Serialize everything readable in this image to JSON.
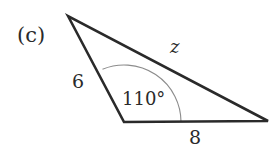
{
  "diagram": {
    "part_label": "(c)",
    "type": "triangle",
    "vertices": {
      "top": [
        68,
        16
      ],
      "bottom_left": [
        124,
        122
      ],
      "right": [
        268,
        121
      ]
    },
    "sides": {
      "left_side": "6",
      "bottom_side": "8",
      "long_side": "z"
    },
    "angle": {
      "vertex": "bottom_left",
      "label": "110°",
      "value_degrees": 110
    },
    "colors": {
      "stroke": "#2a2a2a",
      "arc": "#8c8c8c",
      "background": "#ffffff"
    }
  }
}
